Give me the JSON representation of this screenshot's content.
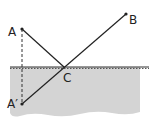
{
  "caption": "",
  "diagram": {
    "type": "reflection-mirror-diagram",
    "colors": {
      "water_fill": "#d4d4d4",
      "line": "#222222",
      "surface": "#333333",
      "background": "#ffffff"
    },
    "points": {
      "A": {
        "label": "A",
        "x": 22,
        "y": 29
      },
      "B": {
        "label": "B",
        "x": 126,
        "y": 14
      },
      "C": {
        "label": "C",
        "x": 64,
        "y": 67
      },
      "A_image": {
        "label": "A′",
        "x": 22,
        "y": 104
      }
    },
    "segments": [
      {
        "from": "A",
        "to": "C",
        "style": "solid"
      },
      {
        "from": "A_image",
        "to": "B",
        "style": "solid"
      },
      {
        "from": "A",
        "to": "A_image",
        "style": "dashed"
      }
    ],
    "surface": {
      "y": 67,
      "x1": 10,
      "x2": 149,
      "style": "dotted-dashed"
    }
  }
}
